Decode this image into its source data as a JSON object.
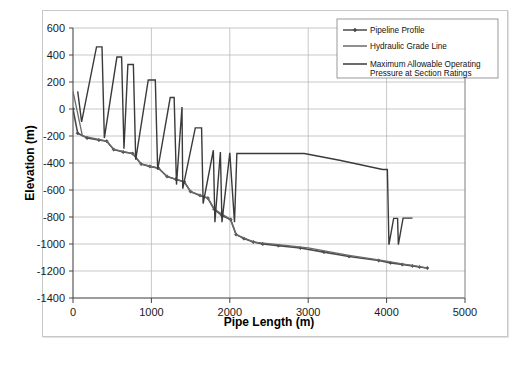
{
  "chart_data": {
    "type": "line",
    "title": "",
    "xlabel": "Pipe Length (m)",
    "ylabel": "Elevation (m)",
    "xlim": [
      0,
      5000
    ],
    "ylim": [
      -1400,
      600
    ],
    "xticks": [
      0,
      1000,
      2000,
      3000,
      4000,
      5000
    ],
    "yticks": [
      -1400,
      -1200,
      -1000,
      -800,
      -600,
      -400,
      -200,
      0,
      200,
      400,
      600
    ],
    "xtick_labels": [
      "0",
      "1000",
      "2000",
      "3000",
      "4000",
      "5000"
    ],
    "ytick_labels": [
      "-1400",
      "-1200",
      "-1000",
      "-800",
      "-600",
      "-400",
      "-200",
      "0",
      "200",
      "400",
      "600"
    ],
    "grid": true,
    "grid_color": "#b0b0b0",
    "legend_position": "top-right",
    "series": [
      {
        "name": "Pipeline Profile",
        "color": "#4a4a4a",
        "marker": "diamond",
        "width": 1.6,
        "points": [
          [
            0,
            0
          ],
          [
            60,
            -180
          ],
          [
            180,
            -215
          ],
          [
            330,
            -230
          ],
          [
            430,
            -238
          ],
          [
            520,
            -300
          ],
          [
            640,
            -318
          ],
          [
            760,
            -330
          ],
          [
            870,
            -408
          ],
          [
            980,
            -425
          ],
          [
            1090,
            -438
          ],
          [
            1200,
            -500
          ],
          [
            1310,
            -520
          ],
          [
            1420,
            -540
          ],
          [
            1500,
            -612
          ],
          [
            1620,
            -640
          ],
          [
            1720,
            -660
          ],
          [
            1800,
            -742
          ],
          [
            1900,
            -790
          ],
          [
            2010,
            -818
          ],
          [
            2080,
            -930
          ],
          [
            2180,
            -960
          ],
          [
            2300,
            -985
          ],
          [
            2420,
            -1000
          ],
          [
            2620,
            -1012
          ],
          [
            2900,
            -1030
          ],
          [
            3200,
            -1060
          ],
          [
            3520,
            -1092
          ],
          [
            3900,
            -1122
          ],
          [
            4050,
            -1140
          ],
          [
            4200,
            -1152
          ],
          [
            4330,
            -1162
          ],
          [
            4420,
            -1170
          ],
          [
            4520,
            -1178
          ]
        ]
      },
      {
        "name": "Hydraulic Grade Line",
        "color": "#6a6a6a",
        "marker": "none",
        "width": 1.3,
        "points": [
          [
            0,
            130
          ],
          [
            120,
            -200
          ],
          [
            430,
            -238
          ],
          [
            520,
            -300
          ],
          [
            760,
            -330
          ],
          [
            870,
            -408
          ],
          [
            1090,
            -438
          ],
          [
            1200,
            -500
          ],
          [
            1420,
            -540
          ],
          [
            1500,
            -612
          ],
          [
            1720,
            -660
          ],
          [
            1800,
            -742
          ],
          [
            2010,
            -818
          ],
          [
            2080,
            -930
          ],
          [
            2300,
            -985
          ],
          [
            2620,
            -1005
          ],
          [
            3000,
            -1028
          ],
          [
            3520,
            -1085
          ],
          [
            3900,
            -1118
          ],
          [
            4200,
            -1148
          ],
          [
            4400,
            -1166
          ],
          [
            4520,
            -1178
          ]
        ]
      },
      {
        "name": "Maximum Allowable Operating Pressure at Section Ratings",
        "color": "#3a3a3a",
        "marker": "none",
        "width": 1.4,
        "points": [
          [
            60,
            130
          ],
          [
            110,
            -95
          ],
          [
            300,
            460
          ],
          [
            370,
            460
          ],
          [
            400,
            -215
          ],
          [
            560,
            385
          ],
          [
            620,
            385
          ],
          [
            650,
            -295
          ],
          [
            700,
            330
          ],
          [
            770,
            330
          ],
          [
            800,
            -375
          ],
          [
            960,
            215
          ],
          [
            1050,
            215
          ],
          [
            1080,
            -450
          ],
          [
            1240,
            85
          ],
          [
            1290,
            85
          ],
          [
            1320,
            -560
          ],
          [
            1390,
            15
          ],
          [
            1400,
            -590
          ],
          [
            1560,
            -140
          ],
          [
            1640,
            -140
          ],
          [
            1660,
            -700
          ],
          [
            1790,
            -305
          ],
          [
            1810,
            -838
          ],
          [
            1880,
            -318
          ],
          [
            1900,
            -838
          ],
          [
            2000,
            -325
          ],
          [
            2060,
            -838
          ],
          [
            2090,
            -330
          ],
          [
            2950,
            -330
          ],
          [
            3400,
            -380
          ],
          [
            3950,
            -448
          ],
          [
            4010,
            -448
          ],
          [
            4030,
            -1005
          ],
          [
            4090,
            -810
          ],
          [
            4140,
            -810
          ],
          [
            4150,
            -1005
          ],
          [
            4210,
            -808
          ],
          [
            4330,
            -808
          ]
        ]
      }
    ]
  },
  "legend": {
    "items": [
      {
        "label": "Pipeline Profile",
        "marker": "diamond"
      },
      {
        "label": "Hydraulic Grade Line",
        "marker": "none"
      },
      {
        "label": "Maximum Allowable Operating",
        "label2": "Pressure at Section Ratings",
        "marker": "none"
      }
    ]
  }
}
